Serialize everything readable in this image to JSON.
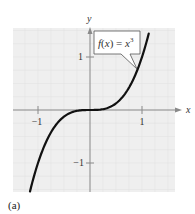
{
  "chart_data": {
    "type": "line",
    "title": "",
    "function": "f(x) = x^3",
    "annotation": "f(x) = x³",
    "xlabel": "x",
    "ylabel": "y",
    "xlim": [
      -1.5,
      1.5
    ],
    "ylim": [
      -1.5,
      1.5
    ],
    "x_ticks": [
      -1,
      1
    ],
    "y_ticks": [
      1,
      -1
    ],
    "x_tick_labels": [
      "−1",
      "1"
    ],
    "y_tick_labels": [
      "1",
      "−1"
    ],
    "grid": true,
    "series": [
      {
        "name": "f(x) = x^3",
        "x": [
          -1.14,
          -1,
          -0.75,
          -0.5,
          -0.25,
          0,
          0.25,
          0.5,
          0.75,
          1,
          1.14
        ],
        "y": [
          -1.48,
          -1,
          -0.42,
          -0.125,
          -0.016,
          0,
          0.016,
          0.125,
          0.42,
          1,
          1.48
        ]
      }
    ],
    "legend": "none"
  },
  "caption": "(a)",
  "colors": {
    "plot_background": "#efefef",
    "grid": "#e2e2e2",
    "axis": "#8a8a8a",
    "curve": "#111111"
  }
}
